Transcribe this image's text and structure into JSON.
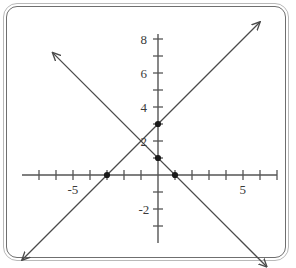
{
  "figure": {
    "kind": "coordinate-plane-graph",
    "border_color": "#6f6f6f",
    "axis_color": "#555555",
    "line_color": "#4a4a4a",
    "point_color": "#1a1a1a",
    "label_color": "#3a3a3a"
  },
  "chart_data": {
    "type": "line",
    "title": "",
    "xlabel": "",
    "ylabel": "",
    "xlim": [
      -8,
      7
    ],
    "ylim": [
      -4,
      8.3
    ],
    "grid": false,
    "legend": "none",
    "x_ticks": [
      -7,
      -6,
      -5,
      -4,
      -3,
      -2,
      -1,
      1,
      2,
      3,
      4,
      5,
      6,
      7
    ],
    "y_ticks": [
      -3,
      -2,
      -1,
      1,
      2,
      3,
      4,
      5,
      6,
      7,
      8
    ],
    "x_tick_labels": [
      {
        "value": -5,
        "text": "-5"
      },
      {
        "value": 5,
        "text": "5"
      }
    ],
    "y_tick_labels": [
      {
        "value": 8,
        "text": "8"
      },
      {
        "value": 6,
        "text": "6"
      },
      {
        "value": 4,
        "text": "4"
      },
      {
        "value": 2,
        "text": "2"
      },
      {
        "value": -2,
        "text": "-2"
      }
    ],
    "series": [
      {
        "name": "rising-line",
        "equation": "y = x + 3",
        "slope": 1,
        "intercept": 3,
        "x": [
          -8.0,
          6.0
        ],
        "y": [
          -5.0,
          9.0
        ],
        "arrow_start": true,
        "arrow_end": true
      },
      {
        "name": "falling-line",
        "equation": "y = -x + 1",
        "slope": -1,
        "intercept": 1,
        "x": [
          -6.2,
          6.4
        ],
        "y": [
          7.2,
          -5.4
        ],
        "arrow_start": true,
        "arrow_end": true
      }
    ],
    "points": [
      {
        "name": "y-intercept-rising",
        "x": 0,
        "y": 3
      },
      {
        "name": "y-intercept-falling",
        "x": 0,
        "y": 1
      },
      {
        "name": "x-intercept-rising",
        "x": -3,
        "y": 0
      },
      {
        "name": "x-intercept-falling",
        "x": 1,
        "y": 0
      }
    ]
  }
}
